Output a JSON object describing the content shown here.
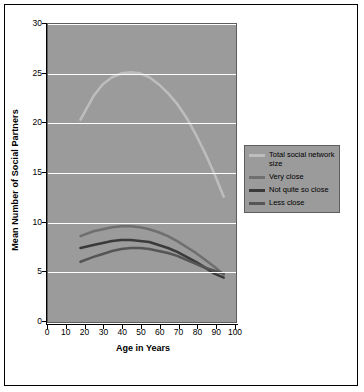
{
  "chart_data": {
    "type": "line",
    "title": "",
    "xlabel": "Age in Years",
    "ylabel": "Mean Number of Social Partners",
    "xlim": [
      0,
      100
    ],
    "ylim": [
      0,
      30
    ],
    "xticks": [
      "0",
      "10",
      "20",
      "30",
      "40",
      "50",
      "60",
      "70",
      "80",
      "90",
      "100"
    ],
    "yticks": [
      "0",
      "5",
      "10",
      "15",
      "20",
      "25",
      "30"
    ],
    "grid": "horizontal",
    "legend_position": "right",
    "plot_background": "#9b9b9b",
    "series": [
      {
        "name": "Total social network size",
        "color": "#bdbdbd",
        "x": [
          18,
          25,
          30,
          35,
          40,
          45,
          50,
          55,
          60,
          65,
          70,
          75,
          80,
          85,
          90,
          95
        ],
        "y": [
          20.2,
          22.6,
          23.8,
          24.5,
          24.9,
          25.0,
          24.9,
          24.5,
          23.8,
          22.9,
          21.8,
          20.4,
          18.7,
          16.8,
          14.7,
          12.4
        ]
      },
      {
        "name": "Very close",
        "color": "#6f6f6f",
        "x": [
          18,
          25,
          30,
          35,
          40,
          45,
          50,
          55,
          60,
          65,
          70,
          75,
          80,
          85,
          90,
          95
        ],
        "y": [
          8.4,
          8.9,
          9.1,
          9.3,
          9.4,
          9.4,
          9.3,
          9.1,
          8.8,
          8.4,
          7.9,
          7.3,
          6.7,
          6.0,
          5.3,
          4.5
        ]
      },
      {
        "name": "Not quite so close",
        "color": "#3a3a3a",
        "x": [
          18,
          25,
          30,
          35,
          40,
          45,
          50,
          55,
          60,
          65,
          70,
          75,
          80,
          85,
          90,
          95
        ],
        "y": [
          7.2,
          7.5,
          7.7,
          7.9,
          8.0,
          8.0,
          7.9,
          7.8,
          7.5,
          7.2,
          6.8,
          6.3,
          5.8,
          5.2,
          4.6,
          4.2
        ]
      },
      {
        "name": "Less close",
        "color": "#555555",
        "x": [
          18,
          25,
          30,
          35,
          40,
          45,
          50,
          55,
          60,
          65,
          70,
          75,
          80,
          85,
          90,
          95
        ],
        "y": [
          5.8,
          6.3,
          6.6,
          6.9,
          7.1,
          7.2,
          7.2,
          7.1,
          6.9,
          6.7,
          6.4,
          6.0,
          5.6,
          5.2,
          4.9,
          4.6
        ]
      }
    ]
  },
  "legend": {
    "items": [
      {
        "label": "Total social network size",
        "color": "#bdbdbd"
      },
      {
        "label": "Very close",
        "color": "#6f6f6f"
      },
      {
        "label": "Not quite so close",
        "color": "#3a3a3a"
      },
      {
        "label": "Less close",
        "color": "#555555"
      }
    ]
  }
}
